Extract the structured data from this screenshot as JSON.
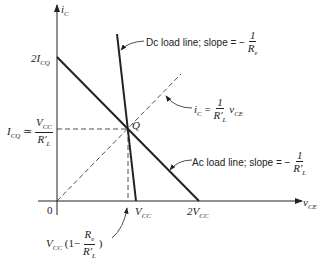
{
  "diagram": {
    "axes": {
      "y_label": "i",
      "y_sub": "C",
      "x_label": "v",
      "x_sub": "CE",
      "origin": "0"
    },
    "y_ticks": {
      "two_icq": "2I",
      "two_icq_sub": "CQ",
      "icq": "I",
      "icq_sub": "CQ",
      "approx": "≃",
      "icq_num": "V",
      "icq_num_sub": "CC",
      "icq_den": "R′",
      "icq_den_sub": "L"
    },
    "x_ticks": {
      "vcc": "V",
      "vcc_sub": "CC",
      "two_vcc": "2V",
      "two_vcc_sub": "CC",
      "vq_prefix": "V",
      "vq_prefix_sub": "CC",
      "vq_open": "(1−",
      "vq_num": "R",
      "vq_num_sub": "e",
      "vq_den": "R′",
      "vq_den_sub": "L",
      "vq_close": ")"
    },
    "point_label": "Q",
    "annotations": {
      "dc": {
        "text": "Dc load line; slope = −",
        "num": "1",
        "den": "R",
        "den_sub": "e"
      },
      "ac": {
        "text": "Ac load line; slope = −",
        "num": "1",
        "den": "R′",
        "den_sub": "L"
      },
      "diag": {
        "lhs": "i",
        "lhs_sub": "C",
        "eq": " = ",
        "num": "1",
        "den": "R′",
        "den_sub": "L",
        "rhs": "v",
        "rhs_sub": "CE"
      }
    },
    "colors": {
      "line": "#222222",
      "background": "#ffffff"
    }
  }
}
